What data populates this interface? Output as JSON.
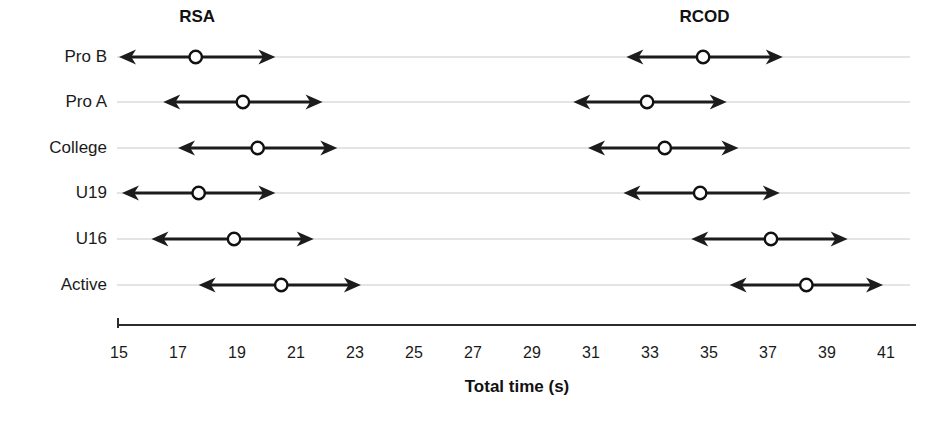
{
  "chart_data": {
    "type": "scatter",
    "title": "",
    "xlabel": "Total time (s)",
    "ylabel": "",
    "xlim": [
      15,
      41
    ],
    "ylim": [
      0,
      6
    ],
    "grid": true,
    "legend_position": "top-inline",
    "xticks": [
      15,
      17,
      19,
      21,
      23,
      25,
      27,
      29,
      31,
      33,
      35,
      37,
      39,
      41
    ],
    "xtick_labels": [
      "15",
      "17",
      "19",
      "21",
      "23",
      "25",
      "27",
      "29",
      "31",
      "33",
      "35",
      "37",
      "39",
      "41"
    ],
    "categories": [
      "Pro B",
      "Pro A",
      "College",
      "U19",
      "U16",
      "Active"
    ],
    "group_labels": [
      "RSA",
      "RCOD"
    ],
    "series": [
      {
        "name": "RSA",
        "marker": "open-circle",
        "error_style": "double-headed-arrow",
        "values": [
          17.6,
          19.2,
          19.7,
          17.7,
          18.9,
          20.5
        ],
        "low": [
          15.0,
          16.5,
          17.0,
          15.1,
          16.1,
          17.7
        ],
        "high": [
          20.3,
          21.9,
          22.4,
          20.3,
          21.6,
          23.2
        ]
      },
      {
        "name": "RCOD",
        "marker": "open-circle",
        "error_style": "double-headed-arrow",
        "values": [
          34.8,
          32.9,
          33.5,
          34.7,
          37.1,
          38.3
        ],
        "low": [
          32.2,
          30.4,
          30.9,
          32.1,
          34.4,
          35.7
        ],
        "high": [
          37.5,
          35.6,
          36.0,
          37.4,
          39.7,
          40.9
        ]
      }
    ],
    "points": [
      {
        "category": "Pro B",
        "group": "RSA",
        "mean": 17.6,
        "low": 15.0,
        "high": 20.3
      },
      {
        "category": "Pro B",
        "group": "RCOD",
        "mean": 34.8,
        "low": 32.2,
        "high": 37.5
      },
      {
        "category": "Pro A",
        "group": "RSA",
        "mean": 19.2,
        "low": 16.5,
        "high": 21.9
      },
      {
        "category": "Pro A",
        "group": "RCOD",
        "mean": 32.9,
        "low": 30.4,
        "high": 35.6
      },
      {
        "category": "College",
        "group": "RSA",
        "mean": 19.7,
        "low": 17.0,
        "high": 22.4
      },
      {
        "category": "College",
        "group": "RCOD",
        "mean": 33.5,
        "low": 30.9,
        "high": 36.0
      },
      {
        "category": "U19",
        "group": "RSA",
        "mean": 17.7,
        "low": 15.1,
        "high": 20.3
      },
      {
        "category": "U19",
        "group": "RCOD",
        "mean": 34.7,
        "low": 32.1,
        "high": 37.4
      },
      {
        "category": "U16",
        "group": "RSA",
        "mean": 18.9,
        "low": 16.1,
        "high": 21.6
      },
      {
        "category": "U16",
        "group": "RCOD",
        "mean": 37.1,
        "low": 34.4,
        "high": 39.7
      },
      {
        "category": "Active",
        "group": "RSA",
        "mean": 20.5,
        "low": 17.7,
        "high": 23.2
      },
      {
        "category": "Active",
        "group": "RCOD",
        "mean": 38.3,
        "low": 35.7,
        "high": 40.9
      }
    ],
    "colors": {
      "marker_stroke": "#111111",
      "marker_fill": "#ffffff",
      "bar": "#1c1c1c",
      "grid": "#c9c9c9",
      "axis": "#2b2b2b",
      "text": "#1a1a1a"
    }
  },
  "geometry": {
    "x_at_15": 119,
    "px_per_unit": 29.5,
    "row_y": [
      57,
      102,
      148,
      193,
      239,
      285
    ],
    "axis_y": 325,
    "tick_label_y": 352,
    "group_title_y": 22,
    "axis_title_y": 392,
    "group_title_x": [
      "RSA",
      "RCOD"
    ]
  }
}
